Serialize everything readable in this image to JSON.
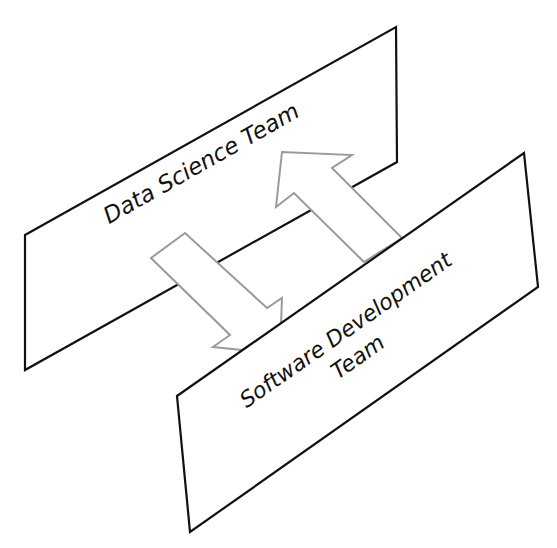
{
  "diagram": {
    "top_plane": {
      "label": "Data Science Team",
      "points": "25,235 396,27 397,162 25,370"
    },
    "bottom_plane": {
      "label_line1": "Software Development",
      "label_line2": "Team",
      "points": "177,396 524,153 538,287 190,532"
    },
    "arrows": [
      {
        "name": "data-science-to-software-dev",
        "direction": "down"
      },
      {
        "name": "software-dev-to-data-science",
        "direction": "up"
      }
    ],
    "colors": {
      "plane_stroke": "#111111",
      "arrow_stroke": "#9a9a9a",
      "fill": "#ffffff"
    }
  }
}
